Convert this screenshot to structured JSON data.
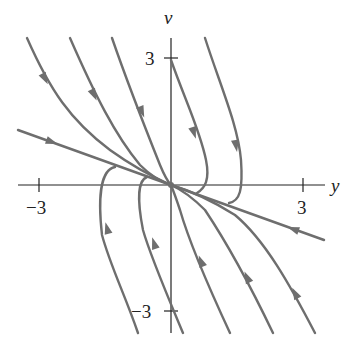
{
  "figure": {
    "x_axis_label": "y",
    "y_axis_label": "v",
    "x_ticks": [
      {
        "value": -3,
        "label": "−3"
      },
      {
        "value": 3,
        "label": "3"
      }
    ],
    "y_ticks": [
      {
        "value": 3,
        "label": "3"
      },
      {
        "value": -3,
        "label": "−3"
      }
    ],
    "equilibrium": {
      "y": 0,
      "v": 0
    },
    "curve_color": "#6e6e6e",
    "axis_color": "#222222"
  }
}
